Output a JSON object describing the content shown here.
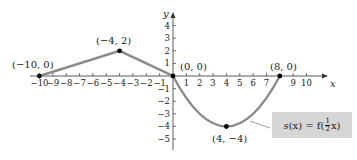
{
  "chart_data": {
    "type": "line",
    "title": "",
    "xlabel": "x",
    "ylabel": "y",
    "xlim": [
      -10,
      10
    ],
    "ylim": [
      -5,
      4
    ],
    "x_ticks": [
      "-10",
      "-9",
      "-8",
      "-7",
      "-6",
      "-5",
      "-4",
      "-3",
      "-2",
      "-1",
      "1",
      "2",
      "3",
      "4",
      "5",
      "6",
      "7",
      "9",
      "10"
    ],
    "y_ticks": [
      "4",
      "3",
      "2",
      "1",
      "-1",
      "-2",
      "-3",
      "-4",
      "-5"
    ],
    "grid": false,
    "series": [
      {
        "name": "s(x) = f(1/2 x)",
        "points": [
          [
            -10,
            0
          ],
          [
            -4,
            2
          ],
          [
            0,
            0
          ],
          [
            4,
            -4
          ],
          [
            8,
            0
          ]
        ],
        "segments": [
          "line from (-10,0) to (-4,2)",
          "line from (-4,2) to (0,0)",
          "parabola from (0,0) through (4,-4) to (8,0)"
        ]
      }
    ],
    "annotations": [
      {
        "text": "(−10, 0)",
        "x": -10,
        "y": 0
      },
      {
        "text": "(−4, 2)",
        "x": -4,
        "y": 2
      },
      {
        "text": "(0, 0)",
        "x": 0,
        "y": 0
      },
      {
        "text": "(8, 0)",
        "x": 8,
        "y": 0
      },
      {
        "text": "(4, −4)",
        "x": 4,
        "y": -4
      }
    ],
    "legend": {
      "text": "s(x) = f(½x)",
      "position": "lower right"
    }
  },
  "labels": {
    "p1": "(−10, 0)",
    "p2": "(−4, 2)",
    "p3": "(0, 0)",
    "p4": "(8, 0)",
    "p5": "(4, −4)",
    "x_axis": "x",
    "y_axis": "y",
    "legend_s": "s",
    "legend_mid": "(x) = f(",
    "legend_end": "x)"
  },
  "style": {
    "curve_color": "#8a8a8a",
    "legend_bg": "#d6d6d6"
  }
}
